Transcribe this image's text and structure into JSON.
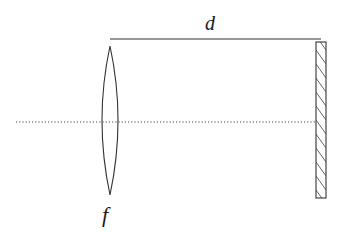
{
  "diagram": {
    "labels": {
      "distance": "d",
      "focal_length": "f"
    },
    "elements": [
      {
        "type": "thin-lens",
        "label": "f"
      },
      {
        "type": "plane-mirror",
        "style": "hatched"
      },
      {
        "type": "optical-axis",
        "style": "dotted"
      },
      {
        "type": "distance-marker",
        "label": "d"
      }
    ],
    "colors": {
      "stroke": "#333333",
      "hatch": "#555555",
      "axis": "#444444",
      "background": "#ffffff"
    }
  }
}
